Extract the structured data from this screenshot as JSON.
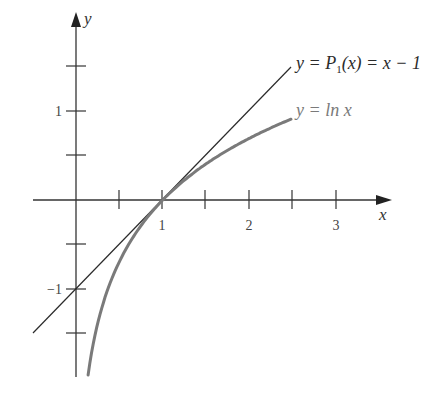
{
  "chart_data": {
    "type": "line",
    "title": "",
    "xlabel": "x",
    "ylabel": "y",
    "xlim": [
      -0.5,
      3.6
    ],
    "ylim": [
      -2.0,
      2.1
    ],
    "grid": false,
    "x_ticks": [
      0.5,
      1,
      1.5,
      2,
      2.5,
      3
    ],
    "x_tick_labels": {
      "1": "1",
      "2": "2",
      "3": "3"
    },
    "y_ticks": [
      -1.5,
      -1,
      -0.5,
      0.5,
      1,
      1.5
    ],
    "y_tick_labels": {
      "1": "1",
      "-1": "−1"
    },
    "series": [
      {
        "name": "y = P1(x) = x − 1",
        "function": "x - 1",
        "x_range": [
          -0.5,
          2.48
        ],
        "color": "#2b2b2b",
        "label_parts": [
          "y = ",
          "P",
          "1",
          "(x) = x − 1"
        ]
      },
      {
        "name": "y = ln x",
        "function": "ln(x)",
        "x_range": [
          0.14,
          2.48
        ],
        "color": "#7a7a7a",
        "label_parts": [
          "y = ln x"
        ]
      }
    ],
    "annotations": [
      {
        "text": "y = P1(x) = x − 1",
        "points_to": [
          2.48,
          1.48
        ]
      },
      {
        "text": "y = ln x",
        "points_to": [
          2.48,
          0.91
        ]
      }
    ]
  },
  "labels": {
    "x_axis": "x",
    "y_axis": "y",
    "x_tick_1": "1",
    "x_tick_2": "2",
    "x_tick_3": "3",
    "y_tick_1": "1",
    "y_tick_neg1": "−1",
    "p1_prefix": "y = ",
    "p1_P": "P",
    "p1_sub": "1",
    "p1_suffix": "(x) = x − 1",
    "ln_label": "y = ln x"
  }
}
